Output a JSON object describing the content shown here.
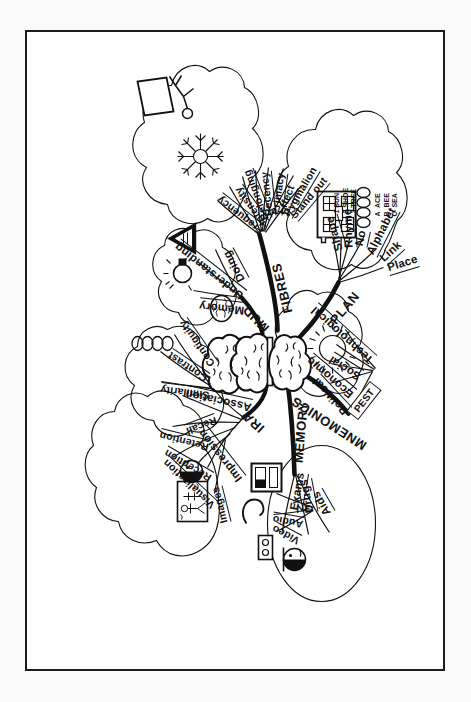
{
  "document": {
    "type": "hand-drawn mind map",
    "title": "MEMORY",
    "orientation": "rotated 90 degrees (landscape map on portrait page)",
    "frame": "thin black rectangular border",
    "ink_color": "#111111",
    "paper_color": "#ffffff"
  },
  "center": {
    "label": "MEMORY",
    "icon": "brain-icon"
  },
  "branches": [
    {
      "id": "ira",
      "label": "IRA",
      "children": [
        {
          "label": "Impression",
          "children": [
            {
              "label": "Images"
            },
            {
              "label": "Visualization"
            },
            {
              "label": "Reception"
            },
            {
              "label": "Retention"
            },
            {
              "label": "Recall"
            }
          ],
          "icons": [
            "face-icon",
            "skeleton-picture-icon"
          ]
        },
        {
          "label": "Association",
          "children": [
            {
              "label": "Similarity"
            },
            {
              "label": "Contrast"
            },
            {
              "label": "Contiguity"
            }
          ],
          "icons": [
            "chain-links-icon"
          ]
        }
      ]
    },
    {
      "id": "mud",
      "label": "MUD",
      "children": [
        {
          "label": "Memory",
          "icons": [
            "brain-icon"
          ]
        },
        {
          "label": "Understanding",
          "icons": [
            "lightbulb-icon"
          ]
        },
        {
          "label": "Doing",
          "icons": [
            "triangle-warning-icon"
          ]
        }
      ]
    },
    {
      "id": "fibres",
      "label": "FIBRES",
      "children": [
        {
          "label": "Frequency"
        },
        {
          "label": "Intensity"
        },
        {
          "label": "Belonging"
        },
        {
          "label": "Recency"
        },
        {
          "label": "Primacy"
        },
        {
          "label": "Effect"
        },
        {
          "label": "Pygmalion"
        },
        {
          "label": "Stand out"
        }
      ],
      "icons": [
        "snowflake-icon",
        "presenter-at-board-icon"
      ]
    },
    {
      "id": "plan",
      "label": "PLAN",
      "children": [
        {
          "label": "Place",
          "icons": [
            "house-icon"
          ]
        },
        {
          "label": "Link",
          "icons": [
            "chain-links-icon"
          ]
        },
        {
          "label": "Alphabet",
          "notes": "A  ACE\nB  BEE\nC  SEA"
        },
        {
          "label": "No",
          "notes": "1 SUN\n2 SHOE\n3 TREE"
        },
        {
          "label": "Rhyme"
        },
        {
          "label": "Shape"
        }
      ]
    },
    {
      "id": "mnemonics",
      "label": "MNEMONICS",
      "children": [
        {
          "label": "PEST",
          "boxed": true,
          "children": [
            {
              "label": "Political"
            },
            {
              "label": "Economic"
            },
            {
              "label": "Social"
            },
            {
              "label": "Technological"
            }
          ],
          "icons": [
            "sun-icon"
          ]
        }
      ]
    },
    {
      "id": "memory",
      "label": "MEMORY",
      "children": [
        {
          "label": "Exams",
          "icons": [
            "face-icon"
          ]
        },
        {
          "label": "Drugs"
        },
        {
          "label": "Aids",
          "children": [
            {
              "label": "Video",
              "icons": [
                "video-camera-icon"
              ]
            },
            {
              "label": "Audio",
              "icons": [
                "audio-wave-icon"
              ]
            },
            {
              "label": "TV",
              "icons": [
                "tv-icon"
              ]
            }
          ]
        }
      ]
    }
  ],
  "labels": {
    "trunks": {
      "ira": "IRA",
      "mud": "MUD",
      "fibres": "FIBRES",
      "plan": "PLAN",
      "mnemonics": "MNEMONICS",
      "memory": "MEMORY"
    },
    "ira": {
      "impression": "Impression",
      "association": "Association",
      "images": "Images",
      "visualization": "Visualization",
      "reception": "Reception",
      "retention": "Retention",
      "recall": "Recall",
      "similarity": "Similarity",
      "contrast": "Contrast",
      "contiguity": "Contiguity"
    },
    "mud": {
      "memory": "Memory",
      "understanding": "Understanding",
      "doing": "Doing"
    },
    "fibres": {
      "frequency": "Frequency",
      "intensity": "Intensity",
      "belonging": "Belonging",
      "recency": "Recency",
      "primacy": "Primacy",
      "effect": "Effect",
      "pygmalion": "Pygmalion",
      "standout": "Stand out"
    },
    "plan": {
      "place": "Place",
      "link": "Link",
      "alphabet": "Alphabet",
      "no": "No",
      "rhyme": "Rhyme",
      "shape": "Shape",
      "alphabet_notes": "A  ACE\nB  BEE\nC  SEA",
      "no_notes": "1 SUN\n2 SHOE\n3 TREE"
    },
    "pest": {
      "tag": "PEST",
      "political": "Political",
      "economic": "Economic",
      "social": "Social",
      "technological": "Technological"
    },
    "memorybranch": {
      "exams": "Exams",
      "drugs": "Drugs",
      "aids": "Aids",
      "video": "Video",
      "audio": "Audio",
      "tv": "TV"
    }
  }
}
